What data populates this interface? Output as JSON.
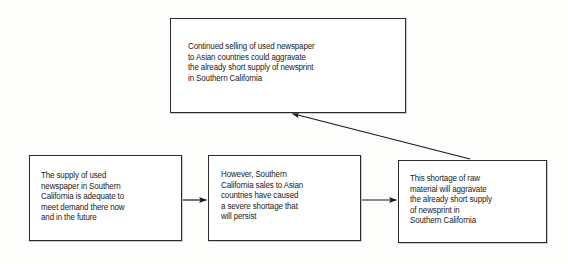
{
  "diagram": {
    "background_color": "#fdfdfc",
    "border_color": "#2b2b2b",
    "text_color": "#1a1a1a",
    "nodes": [
      {
        "id": "top",
        "name": "conclusion-box",
        "text": "Continued selling of used newspaper\nto Asian countries could aggravate\nthe already short supply of newsprint\nin Southern California"
      },
      {
        "id": "a",
        "name": "premise-box-1",
        "text": "The supply of used\nnewspaper in Southern\nCalifornia is adequate to\nmeet demand there now\nand in the future"
      },
      {
        "id": "b",
        "name": "premise-box-2",
        "text": "However, Southern\nCalifornia sales to Asian\ncountries have caused\na severe shortage that\nwill persist"
      },
      {
        "id": "c",
        "name": "premise-box-3",
        "text": "This shortage of raw\nmaterial will aggravate\nthe already short supply\nof newsprint in\nSouthern California"
      }
    ],
    "edges": [
      {
        "id": "a-to-b",
        "name": "arrow-premise1-to-premise2",
        "from": "a",
        "to": "b",
        "style": "horizontal"
      },
      {
        "id": "b-to-c",
        "name": "arrow-premise2-to-premise3",
        "from": "b",
        "to": "c",
        "style": "horizontal"
      },
      {
        "id": "c-to-top",
        "name": "arrow-premise3-to-conclusion",
        "from": "c",
        "to": "top",
        "style": "diagonal"
      }
    ]
  }
}
